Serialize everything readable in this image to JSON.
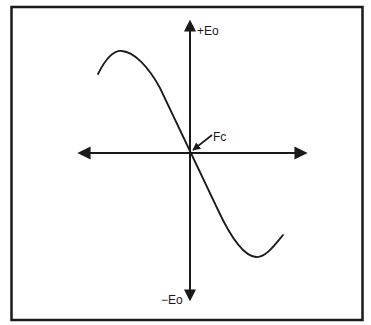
{
  "diagram": {
    "type": "frequency-discriminator-s-curve",
    "labels": {
      "positive_axis": "+Eo",
      "negative_axis": "−Eo",
      "center": "Fc"
    },
    "colors": {
      "stroke": "#1a1a1a",
      "background": "#ffffff"
    }
  }
}
